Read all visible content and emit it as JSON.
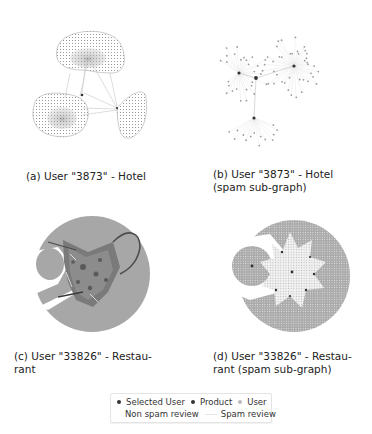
{
  "figure": {
    "panels": [
      {
        "id": "a",
        "caption": "(a) User \"3873\" - Hotel"
      },
      {
        "id": "b",
        "caption_line1": "(b) User \"3873\" - Hotel",
        "caption_line2": "(spam sub-graph)"
      },
      {
        "id": "c",
        "caption_line1": "(c) User \"33826\" - Restau-",
        "caption_line2": "rant"
      },
      {
        "id": "d",
        "caption_line1": "(d) User \"33826\" - Restau-",
        "caption_line2": "rant (spam sub-graph)"
      }
    ],
    "legend": {
      "items": [
        {
          "label": "Selected User",
          "marker": "dot",
          "color": "#333333"
        },
        {
          "label": "Product",
          "marker": "dot",
          "color": "#333333"
        },
        {
          "label": "User",
          "marker": "dot",
          "color": "#bbbbbb"
        },
        {
          "label": "Non spam review",
          "marker": "line",
          "color": "#cfcfcf"
        },
        {
          "label": "Spam review",
          "marker": "line",
          "color": "#e4e4e4"
        }
      ]
    },
    "colors": {
      "node_dark": "#333333",
      "node_light": "#9a9a9a",
      "fill_gray": "#a8a8a8",
      "fill_dark": "#555555"
    }
  }
}
